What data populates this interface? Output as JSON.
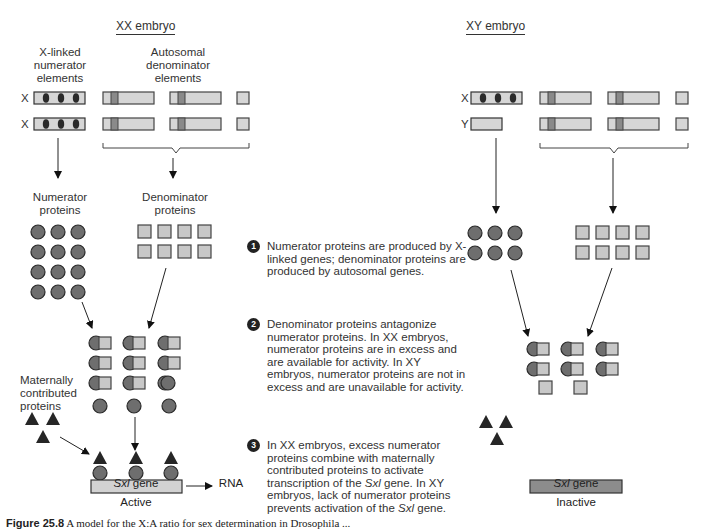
{
  "colors": {
    "numerator_fill": "#6e6e6e",
    "numerator_stroke": "#2a2a2a",
    "denominator_fill": "#c8c8c8",
    "denominator_stroke": "#444444",
    "chromosome_fill": "#d6d6d6",
    "band_fill": "#8a8a8a",
    "maternal_fill": "#262626",
    "gene_active_fill": "#d2d2d2",
    "gene_inactive_fill": "#8c8c8c"
  },
  "xx": {
    "title": "XX embryo",
    "numerator_elements_label": "X-linked\nnumerator\nelements",
    "denominator_elements_label": "Autosomal\ndenominator\nelements",
    "chromosome_labels": [
      "X",
      "X"
    ],
    "numerator_proteins_label": "Numerator\nproteins",
    "denominator_proteins_label": "Denominator\nproteins",
    "numerator_protein_count": 12,
    "denominator_protein_count": 8,
    "maternal_label": "Maternally\ncontributed\nproteins",
    "gene_label": "Sxl",
    "gene_suffix": " gene",
    "gene_output": "RNA",
    "status": "Active"
  },
  "xy": {
    "title": "XY embryo",
    "chromosome_labels": [
      "X",
      "Y"
    ],
    "numerator_protein_count": 6,
    "denominator_protein_count": 8,
    "gene_label": "Sxl",
    "gene_suffix": " gene",
    "status": "Inactive"
  },
  "steps": [
    {
      "num": "1",
      "text": "Numerator proteins are produced by X-linked genes; denominator proteins are produced by autosomal genes."
    },
    {
      "num": "2",
      "text": "Denominator proteins antagonize numerator proteins. In XX embryos, numerator proteins are in excess and are available for activity. In XY embryos, numerator proteins are not in excess and are unavailable for activity."
    },
    {
      "num": "3",
      "text_parts": [
        "In XX embryos, excess numerator proteins combine with maternally contributed proteins to activate transcription of the ",
        "Sxl",
        " gene. In XY embryos, lack of numerator proteins prevents activation of the ",
        "Sxl",
        " gene."
      ]
    }
  ],
  "caption": {
    "figure": "Figure 25.8",
    "text": "  A model for the X:A ratio for sex determination in Drosophila ..."
  }
}
